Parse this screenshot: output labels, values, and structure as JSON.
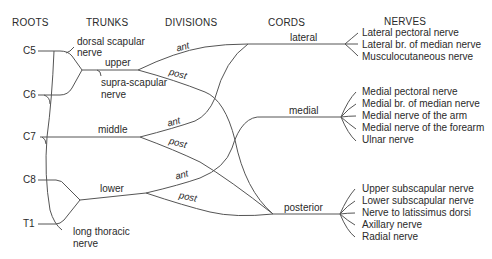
{
  "headers": {
    "roots": "ROOTS",
    "trunks": "TRUNKS",
    "divisions": "DIVISIONS",
    "cords": "CORDS",
    "nerves": "NERVES"
  },
  "roots": [
    "C5",
    "C6",
    "C7",
    "C8",
    "T1"
  ],
  "trunks": {
    "upper": "upper",
    "middle": "middle",
    "lower": "lower"
  },
  "trunk_branches": {
    "dorsal_scapular": [
      "dorsal scapular",
      "nerve"
    ],
    "suprascapular": [
      "supra-scapular",
      "nerve"
    ],
    "long_thoracic": [
      "long thoracic",
      "nerve"
    ]
  },
  "divisions": {
    "upper_ant": "ant",
    "upper_post": "post",
    "middle_ant": "ant",
    "middle_post": "post",
    "lower_ant": "ant",
    "lower_post": "post"
  },
  "cords": {
    "lateral": "lateral",
    "medial": "medial",
    "posterior": "posterior"
  },
  "nerves": {
    "lateral": [
      "Lateral pectoral nerve",
      "Lateral br. of median nerve",
      "Musculocutaneous nerve"
    ],
    "medial": [
      "Medial pectoral nerve",
      "Medial br. of median nerve",
      "Medial nerve of the arm",
      "Medial nerve of the forearm",
      "Ulnar nerve"
    ],
    "posterior": [
      "Upper subscapular nerve",
      "Lower subscapular nerve",
      "Nerve to latissimus dorsi",
      "Axillary nerve",
      "Radial nerve"
    ]
  }
}
